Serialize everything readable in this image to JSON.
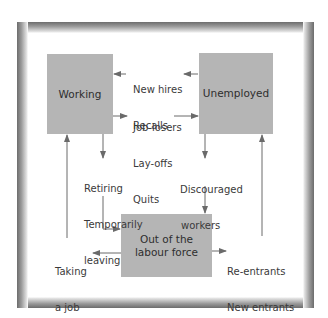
{
  "diagram": {
    "colors": {
      "box_fill": "#b5b5b5",
      "arrow": "#6a6a6a",
      "frame_dark": "#6e6e6e",
      "text": "#3a3a3a"
    },
    "nodes": {
      "working": {
        "label": "Working"
      },
      "unemployed": {
        "label": "Unemployed"
      },
      "out_of_labour_force": {
        "line1": "Out of the",
        "line2": "labour force"
      }
    },
    "flows": {
      "unemployed_to_working": {
        "line1": "New hires",
        "line2": "Recalls"
      },
      "working_to_unemployed": {
        "line1": "Job-losers",
        "line2": "Lay-offs",
        "line3": "Quits"
      },
      "working_to_out": {
        "line1": "Retiring",
        "line2": "Temporarily",
        "line3": "leaving"
      },
      "unemployed_to_out": {
        "line1": "Discouraged",
        "line2": "workers"
      },
      "out_to_working": {
        "line1": "Taking",
        "line2": "a job"
      },
      "out_to_unemployed": {
        "line1": "Re-entrants",
        "line2": "New entrants"
      }
    }
  }
}
